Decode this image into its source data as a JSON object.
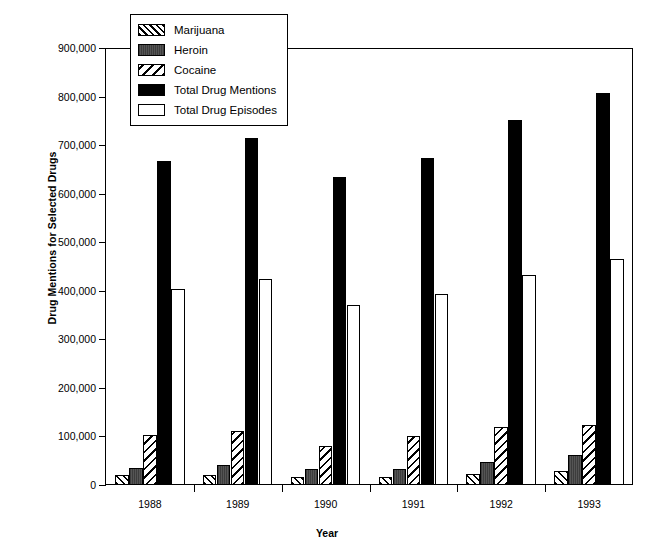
{
  "chart_data": {
    "type": "bar",
    "title": "",
    "xlabel": "Year",
    "ylabel": "Drug Mentions for Selected Drugs",
    "categories": [
      "1988",
      "1989",
      "1990",
      "1991",
      "1992",
      "1993"
    ],
    "ylim": [
      0,
      900000
    ],
    "ytick_values": [
      0,
      100000,
      200000,
      300000,
      400000,
      500000,
      600000,
      700000,
      800000,
      900000
    ],
    "ytick_labels": [
      "0",
      "100,000",
      "200,000",
      "300,000",
      "400,000",
      "500,000",
      "600,000",
      "700,000",
      "800,000",
      "900,000"
    ],
    "grid": false,
    "legend_position": "top-left-inside",
    "series": [
      {
        "name": "Marijuana",
        "fill": "diagonal-hatch-right",
        "color": "#000000",
        "values": [
          20000,
          20000,
          16000,
          16000,
          22000,
          28000
        ]
      },
      {
        "name": "Heroin",
        "fill": "solid-dark-gray",
        "color": "#4a4a4a",
        "values": [
          36000,
          42000,
          32000,
          34000,
          48000,
          62000
        ]
      },
      {
        "name": "Cocaine",
        "fill": "diagonal-hatch-left",
        "color": "#000000",
        "values": [
          102000,
          111000,
          80000,
          101000,
          119000,
          123000
        ]
      },
      {
        "name": "Total Drug Mentions",
        "fill": "solid-black",
        "color": "#000000",
        "values": [
          668000,
          714000,
          635000,
          674000,
          751000,
          808000
        ]
      },
      {
        "name": "Total Drug Episodes",
        "fill": "solid-white",
        "color": "#ffffff",
        "values": [
          404000,
          425000,
          371000,
          394000,
          432000,
          465000
        ]
      }
    ]
  },
  "axes": {
    "y_title": "Drug Mentions for Selected Drugs",
    "x_title": "Year"
  }
}
